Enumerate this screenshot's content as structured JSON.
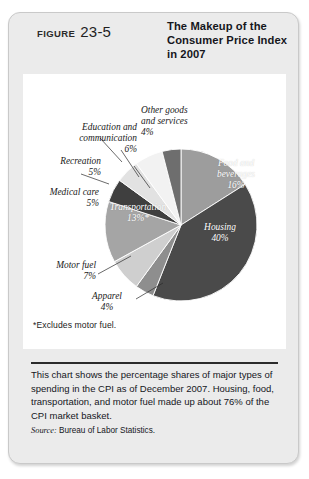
{
  "figure": {
    "label_word": "FIGURE",
    "number": "23-5",
    "title": "The Makeup of the\nConsumer Price\nIndex in 2007"
  },
  "chart_data": {
    "type": "pie",
    "title": "The Makeup of the Consumer Price Index in 2007",
    "units": "percent",
    "legend": "none (labels attached to slices)",
    "categories": [
      "Food and beverages",
      "Housing",
      "Apparel",
      "Motor fuel",
      "Transportation",
      "Medical care",
      "Recreation",
      "Education and communication",
      "Other goods and services"
    ],
    "values": [
      16,
      40,
      4,
      7,
      13,
      5,
      5,
      6,
      4
    ],
    "slices": [
      {
        "name": "Food and beverages",
        "value": 16,
        "label": "Food and\nbeverages\n16%",
        "label_placement": "inside",
        "color": "#9d9d9d",
        "start_deg": 0,
        "end_deg": 57.6
      },
      {
        "name": "Housing",
        "value": 40,
        "label": "Housing\n40%",
        "label_placement": "inside",
        "color": "#4a4a4a",
        "start_deg": 57.6,
        "end_deg": 201.6
      },
      {
        "name": "Apparel",
        "value": 4,
        "label": "Apparel\n4%",
        "label_placement": "outside",
        "color": "#8e8e8e",
        "start_deg": 201.6,
        "end_deg": 216.0
      },
      {
        "name": "Motor fuel",
        "value": 7,
        "label": "Motor fuel\n7%",
        "label_placement": "outside",
        "color": "#cfcfcf",
        "start_deg": 216.0,
        "end_deg": 241.2
      },
      {
        "name": "Transportation",
        "value": 13,
        "label": "Transportation\n13%*",
        "label_placement": "inside",
        "color": "#a5a5a5",
        "start_deg": 241.2,
        "end_deg": 288.0
      },
      {
        "name": "Medical care",
        "value": 5,
        "label": "Medical care\n5%",
        "label_placement": "outside",
        "color": "#3f3f3f",
        "start_deg": 288.0,
        "end_deg": 306.0
      },
      {
        "name": "Recreation",
        "value": 5,
        "label": "Recreation\n5%",
        "label_placement": "outside",
        "color": "#e2e2e2",
        "start_deg": 306.0,
        "end_deg": 324.0
      },
      {
        "name": "Education and communication",
        "value": 6,
        "label": "Education and\ncommunication\n6%",
        "label_placement": "outside",
        "color": "#f2f2f2",
        "start_deg": 324.0,
        "end_deg": 345.6
      },
      {
        "name": "Other goods and services",
        "value": 4,
        "label": "Other goods\nand services\n4%",
        "label_placement": "outside",
        "color": "#6e6e6e",
        "start_deg": 345.6,
        "end_deg": 360.0
      }
    ],
    "footnote": "*Excludes motor fuel."
  },
  "caption": {
    "text": "This chart shows the percentage shares of major types of spending in the CPI as of December 2007. Housing, food, transportation, and motor fuel made up about 76% of the CPI market basket.",
    "source_label": "Source:",
    "source_value": "Bureau of Labor Statistics."
  },
  "colors": {
    "card_background": "#ebebeb",
    "plate_background": "#ffffff",
    "text": "#15161c",
    "rule": "#2b2b2b"
  }
}
